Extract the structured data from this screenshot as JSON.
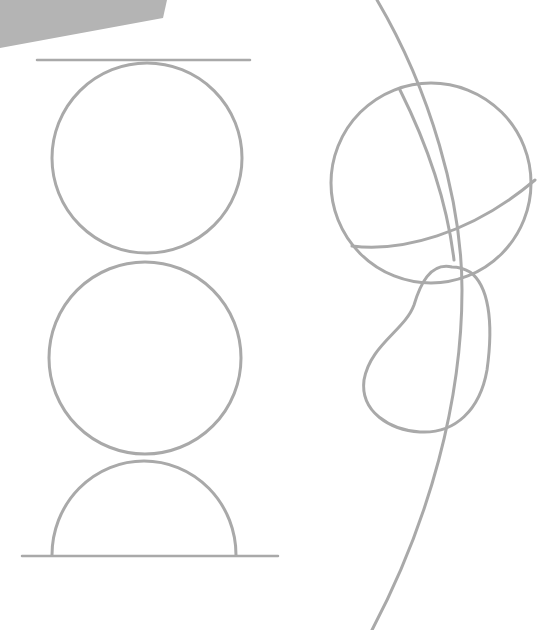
{
  "image": {
    "description": "Pencil construction sketch: stacked circles between guide lines on the left, a sphere with cross-contour arcs and a bean-shaped form on the right",
    "background": "#ffffff",
    "stroke_color": "#a9a9a9",
    "shadow_color": "#b5b5b5"
  },
  "left_stack": {
    "top_line": {
      "x1": 37,
      "y1": 60,
      "x2": 250,
      "y2": 60
    },
    "bottom_line": {
      "x1": 22,
      "y1": 556,
      "x2": 278,
      "y2": 556
    },
    "top_circle": {
      "cx": 147,
      "cy": 158,
      "r": 95
    },
    "middle_circle": {
      "cx": 145,
      "cy": 358,
      "r": 95
    },
    "bottom_semicircle": {
      "cx": 144,
      "cy": 555,
      "r": 92
    }
  },
  "right_figure": {
    "sphere": {
      "cx": 430,
      "cy": 183,
      "r": 100
    }
  }
}
